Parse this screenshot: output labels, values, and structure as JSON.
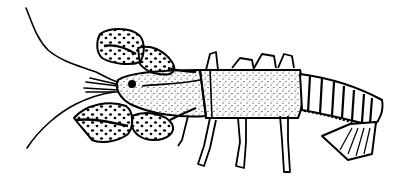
{
  "image": {
    "subject": "crayfish line drawing",
    "background": "#ffffff",
    "ink": "#000000",
    "style": "black-and-white stippled illustration"
  }
}
